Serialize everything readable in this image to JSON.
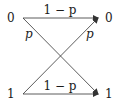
{
  "diagram": {
    "type": "binary-symmetric-channel",
    "inputs": [
      {
        "label": "0",
        "x": 12,
        "y": 18
      },
      {
        "label": "1",
        "x": 12,
        "y": 94
      }
    ],
    "outputs": [
      {
        "label": "0",
        "x": 109,
        "y": 18
      },
      {
        "label": "1",
        "x": 109,
        "y": 94
      }
    ],
    "edges": [
      {
        "from": "0",
        "to": "0",
        "label": "1 − p"
      },
      {
        "from": "0",
        "to": "1",
        "label": "p"
      },
      {
        "from": "1",
        "to": "0",
        "label": "p"
      },
      {
        "from": "1",
        "to": "1",
        "label": "1 − p"
      }
    ],
    "labels": {
      "in0": "0",
      "in1": "1",
      "out0": "0",
      "out1": "1",
      "top_edge": "1 − p",
      "bottom_edge": "1 − p",
      "cross_left": "p",
      "cross_right": "p"
    },
    "colors": {
      "line": "#333333",
      "text": "#1a1a1a",
      "background": "#ffffff"
    }
  }
}
